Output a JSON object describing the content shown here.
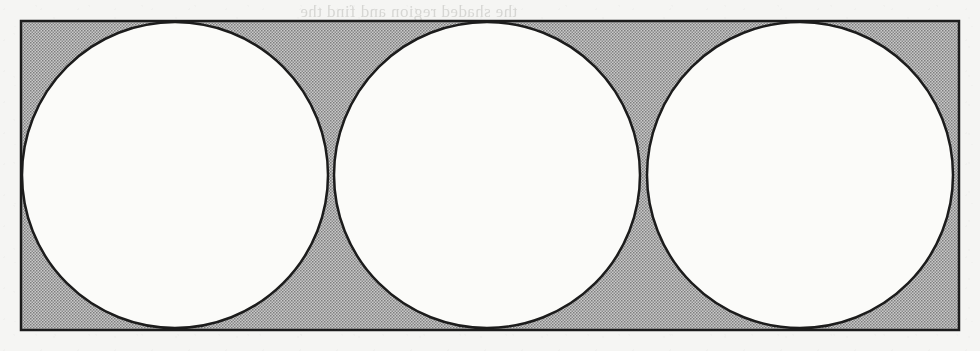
{
  "figure": {
    "background_color": "#f5f5f3",
    "rectangle": {
      "name": "shaded-rectangle",
      "x": 21,
      "y": 21,
      "width": 938,
      "height": 309,
      "fill_color": "#a8a8a8",
      "stroke_color": "#1c1c1c",
      "stroke_width": 2.5
    },
    "circles": [
      {
        "label": "circle-left",
        "cx": 175,
        "cy": 175,
        "r": 153,
        "fill_color": "#fbfbf9",
        "stroke_color": "#1c1c1c",
        "stroke_width": 2.5
      },
      {
        "label": "circle-middle",
        "cx": 487,
        "cy": 175,
        "r": 153,
        "fill_color": "#fbfbf9",
        "stroke_color": "#1c1c1c",
        "stroke_width": 2.5
      },
      {
        "label": "circle-right",
        "cx": 800,
        "cy": 175,
        "r": 153,
        "fill_color": "#fbfbf9",
        "stroke_color": "#1c1c1c",
        "stroke_width": 2.5
      }
    ],
    "tangent_points": [
      {
        "label": "tangency-left-middle",
        "x": 328,
        "y": 176
      },
      {
        "label": "tangency-middle-right",
        "x": 645,
        "y": 176
      }
    ]
  },
  "ghost_text": {
    "note": "Faint mirrored text bleeding through from the reverse side of the scanned page; not legible.",
    "lines": [
      {
        "text": "the shaded region and find the",
        "x": 300,
        "y": 2
      },
      {
        "text": "inside a rectangle as shown",
        "x": 560,
        "y": 80
      },
      {
        "text": "the radius of each circle is",
        "x": 590,
        "y": 124
      },
      {
        "text": "area",
        "x": 690,
        "y": 160
      },
      {
        "text": "and the shaded area is",
        "x": 560,
        "y": 248
      }
    ]
  }
}
